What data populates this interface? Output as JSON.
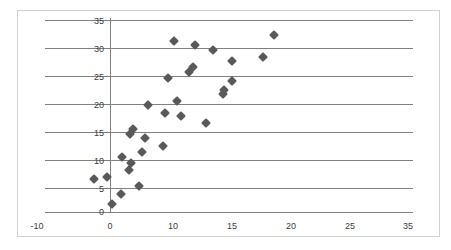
{
  "chart_data": {
    "type": "scatter",
    "title": "",
    "subtitle": "",
    "xlabel": "",
    "ylabel": "",
    "grid": true,
    "legend": false,
    "legend_position": "none",
    "marker_color": "#595959",
    "marker_shape": "diamond",
    "gridline_color": "#808080",
    "axis_color": "#808080",
    "frame_color": "#d2d2d2",
    "xlim": [
      -10,
      35
    ],
    "ylim": [
      0,
      35
    ],
    "xticks": [
      -10,
      0,
      10,
      15,
      20,
      25,
      35
    ],
    "xtick_labels": [
      "-10",
      "0",
      "10",
      "15",
      "20",
      "25",
      "35"
    ],
    "yticks": [
      0,
      5,
      10,
      15,
      20,
      25,
      30,
      35
    ],
    "ytick_labels": [
      "0",
      "5",
      "10",
      "15",
      "20",
      "25",
      "30",
      "35"
    ],
    "n_points": 30,
    "points": [
      {
        "x": -2.5,
        "y": 6.0
      },
      {
        "x": -0.5,
        "y": 6.4
      },
      {
        "x": 0.3,
        "y": 1.5
      },
      {
        "x": 1.8,
        "y": 3.2
      },
      {
        "x": 1.9,
        "y": 10.0
      },
      {
        "x": 3.0,
        "y": 7.6
      },
      {
        "x": 3.4,
        "y": 8.9
      },
      {
        "x": 3.1,
        "y": 14.3
      },
      {
        "x": 3.7,
        "y": 15.1
      },
      {
        "x": 4.6,
        "y": 4.8
      },
      {
        "x": 5.1,
        "y": 11.0
      },
      {
        "x": 5.6,
        "y": 13.4
      },
      {
        "x": 6.0,
        "y": 19.5
      },
      {
        "x": 8.4,
        "y": 12.0
      },
      {
        "x": 8.7,
        "y": 18.1
      },
      {
        "x": 9.2,
        "y": 24.5
      },
      {
        "x": 10.1,
        "y": 31.1
      },
      {
        "x": 10.6,
        "y": 20.3
      },
      {
        "x": 11.2,
        "y": 17.5
      },
      {
        "x": 12.5,
        "y": 25.6
      },
      {
        "x": 13.1,
        "y": 26.4
      },
      {
        "x": 13.5,
        "y": 30.4
      },
      {
        "x": 15.3,
        "y": 16.2
      },
      {
        "x": 16.4,
        "y": 29.6
      },
      {
        "x": 18.0,
        "y": 21.6
      },
      {
        "x": 18.1,
        "y": 22.3
      },
      {
        "x": 19.4,
        "y": 23.8
      },
      {
        "x": 19.3,
        "y": 27.6
      },
      {
        "x": 24.3,
        "y": 28.3
      },
      {
        "x": 26.0,
        "y": 32.2
      }
    ]
  },
  "axes": {
    "y_tick_entries": [
      {
        "label": "35",
        "top": 16
      },
      {
        "label": "30",
        "top": 44
      },
      {
        "label": "25",
        "top": 72
      },
      {
        "label": "20",
        "top": 100
      },
      {
        "label": "15",
        "top": 128
      },
      {
        "label": "10",
        "top": 156
      },
      {
        "label": "5",
        "top": 184
      },
      {
        "label": "0",
        "top": 207
      }
    ],
    "gridline_tops": [
      20,
      48,
      76,
      104,
      132,
      160,
      188
    ],
    "x_tick_entries": [
      {
        "label": "-10",
        "left": 37
      },
      {
        "label": "0",
        "left": 110
      },
      {
        "label": "10",
        "left": 173
      },
      {
        "label": "15",
        "left": 232
      },
      {
        "label": "20",
        "left": 291
      },
      {
        "label": "25",
        "left": 350
      },
      {
        "label": "35",
        "left": 408
      }
    ]
  }
}
